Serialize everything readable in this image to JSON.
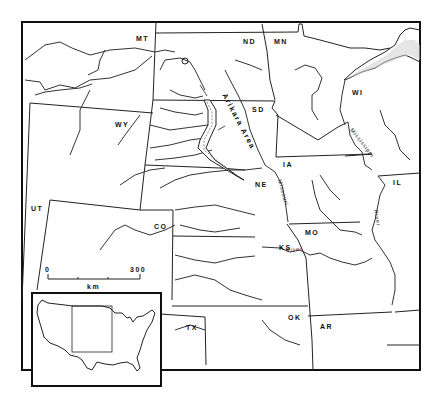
{
  "map": {
    "state_labels": [
      {
        "id": "mt",
        "text": "MT"
      },
      {
        "id": "nd",
        "text": "ND"
      },
      {
        "id": "mn",
        "text": "MN"
      },
      {
        "id": "wi",
        "text": "WI"
      },
      {
        "id": "sd",
        "text": "SD"
      },
      {
        "id": "wy",
        "text": "WY"
      },
      {
        "id": "ia",
        "text": "IA"
      },
      {
        "id": "il",
        "text": "IL"
      },
      {
        "id": "ne",
        "text": "NE"
      },
      {
        "id": "ut",
        "text": "UT"
      },
      {
        "id": "co",
        "text": "CO"
      },
      {
        "id": "mo",
        "text": "MO"
      },
      {
        "id": "ks",
        "text": "KS"
      },
      {
        "id": "tx",
        "text": "TX"
      },
      {
        "id": "ok",
        "text": "OK"
      },
      {
        "id": "ar",
        "text": "AR"
      }
    ],
    "area_label": "Arikara Area",
    "river_labels": {
      "mississippi": "Mississippi",
      "river_east": "River",
      "missouri": "Missouri",
      "river_missouri": "River"
    },
    "scale": {
      "start": "0",
      "end": "300",
      "unit": "km"
    },
    "inset": {
      "description": "United States outline with study region highlighted"
    }
  }
}
